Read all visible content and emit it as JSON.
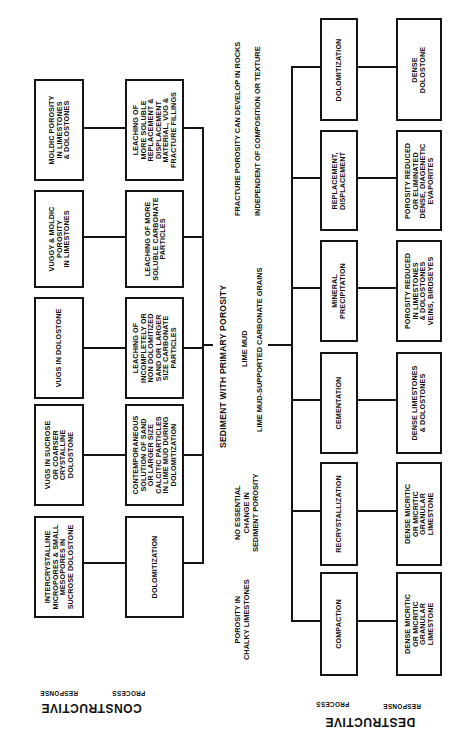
{
  "diagram": {
    "orientation": "rotated 90 degrees counter-clockwise",
    "root": {
      "label": "SEDIMENT WITH PRIMARY POROSITY",
      "sublabels": [
        "LIME MUD",
        "LIME MUD-SUPPORTED CARBONATE GRAINS"
      ]
    },
    "constructive": {
      "title": "CONSTRUCTIVE",
      "process_header": "PROCESS",
      "response_header": "RESPONSE",
      "branches": [
        {
          "process": "LEACHING OF\nMORE SOLUBLE\nREPLACEMENT &\nDISPLACEMENT\nMATERIAL, VUG &\nFRACTURE FILLINGS",
          "response": "MOLDIC POROSITY\nIN LIMESTONES\n& DOLOSTONES"
        },
        {
          "process": "LEACHING OF MORE\nSOLUBLE CARBONATE\nPARTICLES",
          "response": "VUGGY & MOLDIC\nPOROSITY\nIN LIMESTONES"
        },
        {
          "process": "LEACHING OF\nINCOMPLETELY OR\nNON DOLOMITIZED\nSAND OR LARGER\nSIZE CARBONATE\nPARTICLES",
          "response": "VUGS IN DOLOSTONE"
        },
        {
          "process": "CONTEMPORANEOUS\nSOLUTION OF SAND\nOR LARGER SIZE\nCALCITIC PARTICLES\nIN LIME MUD DURING\nDOLOMITIZATION",
          "response": "VUGS IN SUCROSE\nOR COARSER\nCRYSTALLINE\nDOLOSTONE"
        },
        {
          "process": "DOLOMITIZATION",
          "response": "INTERCRYSTALLINE\nMICROPORES & SMALL\nMESOPORES IN\nSUCROSE DOLOSTONE"
        }
      ]
    },
    "destructive": {
      "title": "DESTRUCTIVE",
      "process_header": "PROCESS",
      "response_header": "RESPONSE",
      "branches": [
        {
          "process": "DOLOMITIZATION",
          "response": "DENSE\nDOLOSTONE"
        },
        {
          "process": "REPLACEMENT,\nDISPLACEMENT",
          "response": "POROSITY REDUCED\nOR ELIMINATED\nDENSE, DIAGENETIC\nEVAPORITES"
        },
        {
          "process": "MINERAL\nPRECIPITATION",
          "response": "POROSITY REDUCED\nIN LIMESTONES\n& DOLOSTONES\nVEINS, BIRDSEYES"
        },
        {
          "process": "CEMENTATION",
          "response": "DENSE LIMESTONES\n& DOLOSTONES"
        },
        {
          "process": "RECRYSTALLIZATION",
          "response": "DENSE MICRITIC\nOR MICRITIC\nGRANULAR\nLIMESTONE"
        },
        {
          "process": "COMPACTION",
          "response": "DENSE MICRITIC\nOR MICRITIC\nGRANULAR\nLIMESTONE"
        }
      ]
    },
    "notes": {
      "fracture": "FRACTURE POROSITY CAN DEVELOP IN ROCKS",
      "independent": "INDEPENDENT OF COMPOSITION OR TEXTURE",
      "no_change": "NO ESSENTIAL\nCHANGE IN\nSEDIMENT POROSITY",
      "chalky": "POROSITY IN\nCHALKY LIMESTONES"
    }
  }
}
